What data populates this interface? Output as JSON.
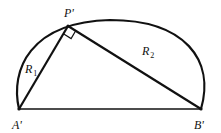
{
  "diagram": {
    "points": {
      "A": {
        "label": "A'",
        "x": 19,
        "y": 109
      },
      "B": {
        "label": "B'",
        "x": 201,
        "y": 109
      },
      "P": {
        "label": "P'",
        "x": 68,
        "y": 26
      }
    },
    "segments": [
      {
        "from": "A",
        "to": "P",
        "label": "R",
        "sub": "1"
      },
      {
        "from": "P",
        "to": "B",
        "label": "R",
        "sub": "2"
      },
      {
        "from": "A",
        "to": "B",
        "label": ""
      }
    ],
    "right_angle_at": "P",
    "colors": {
      "stroke": "#111111",
      "background": "#ffffff"
    }
  }
}
